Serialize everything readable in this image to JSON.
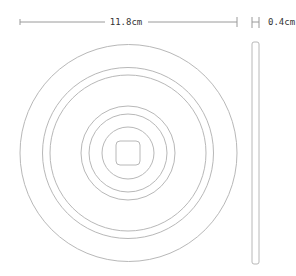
{
  "diagram": {
    "width_dimension": {
      "label": "11.8cm"
    },
    "thickness_dimension": {
      "label": "0.4cm"
    },
    "colors": {
      "line": "#b8b8b8",
      "dim_line": "#9a9a9a",
      "text": "#333333",
      "background": "#ffffff"
    },
    "front_view": {
      "center": [
        128.5,
        153
      ],
      "circle_radii": [
        108.5,
        85.5,
        78,
        47,
        39,
        26
      ],
      "center_square": {
        "size": 24,
        "corner_radius": 4
      }
    },
    "side_view": {
      "x": 252,
      "y": 42,
      "width": 7,
      "height": 222
    }
  }
}
